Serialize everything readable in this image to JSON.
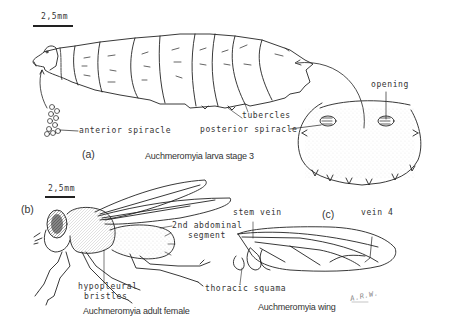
{
  "figure": {
    "panels": {
      "a": {
        "label": "(a)",
        "caption": "Auchmeromyia larva stage 3",
        "scale": "2,5mm",
        "labels": {
          "anterior_spiracle": "anterior spiracle",
          "tubercles": "tubercles",
          "posterior_spiracle": "posterior spiracle",
          "opening": "opening"
        }
      },
      "b": {
        "label": "(b)",
        "caption": "Auchmeromyia adult female",
        "scale": "2,5mm",
        "labels": {
          "abdominal_segment_line1": "2nd abdominal",
          "abdominal_segment_line2": "segment",
          "hypopleural_line1": "hypopleural",
          "hypopleural_line2": "bristles"
        }
      },
      "c": {
        "label": "(c)",
        "caption": "Auchmeromyia wing",
        "labels": {
          "stem_vein": "stem vein",
          "vein4": "vein 4",
          "thoracic_squama": "thoracic squama"
        },
        "signature": "A.R.W."
      }
    }
  }
}
